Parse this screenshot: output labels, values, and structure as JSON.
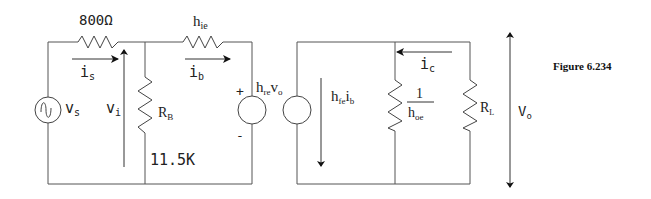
{
  "figure": {
    "caption": "Figure 6.234"
  },
  "labels": {
    "r_series": "800Ω",
    "h_ie": "h",
    "h_ie_sub": "ie",
    "i_s": "i",
    "i_s_sub": "s",
    "i_b": "i",
    "i_b_sub": "b",
    "v_s": "v",
    "v_s_sub": "s",
    "v_i": "v",
    "v_i_sub": "i",
    "r_b": "R",
    "r_b_sub": "B",
    "r_b_value": "11.5K",
    "plus": "+",
    "minus": "-",
    "h_re": "h",
    "h_re_sub": "re",
    "h_re_v": "v",
    "h_re_v_sub": "o",
    "h_fe": "h",
    "h_fe_sub": "fe",
    "h_fe_i": "i",
    "h_fe_i_sub": "b",
    "i_c": "i",
    "i_c_sub": "c",
    "one": "1",
    "h_oe": "h",
    "h_oe_sub": "oe",
    "r_l": "R",
    "r_l_sub": "L",
    "v_o": "V",
    "v_o_sub": "o"
  }
}
